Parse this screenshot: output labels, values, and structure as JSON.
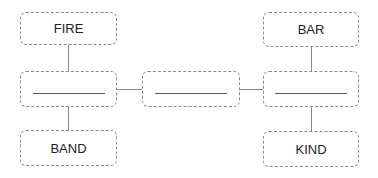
{
  "diagram": {
    "nodes": [
      {
        "id": "fire",
        "label": "FIRE"
      },
      {
        "id": "bar",
        "label": "BAR"
      },
      {
        "id": "band",
        "label": "BAND"
      },
      {
        "id": "kind",
        "label": "KIND"
      },
      {
        "id": "left_blank",
        "label": ""
      },
      {
        "id": "center_blank",
        "label": ""
      },
      {
        "id": "right_blank",
        "label": ""
      }
    ],
    "edges": [
      {
        "from": "fire",
        "to": "left_blank"
      },
      {
        "from": "left_blank",
        "to": "band"
      },
      {
        "from": "left_blank",
        "to": "center_blank"
      },
      {
        "from": "center_blank",
        "to": "right_blank"
      },
      {
        "from": "bar",
        "to": "right_blank"
      },
      {
        "from": "right_blank",
        "to": "kind"
      }
    ],
    "colors": {
      "border": "#8a8a8a",
      "text": "#222222",
      "blank_line": "#555555"
    }
  }
}
